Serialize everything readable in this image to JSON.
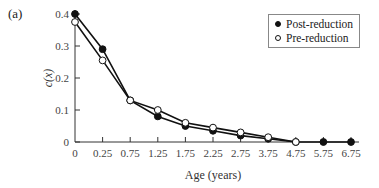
{
  "panel_label": "(a)",
  "legend": {
    "items": [
      {
        "label": "Post-reduction",
        "marker": "filled-circle"
      },
      {
        "label": "Pre-reduction",
        "marker": "open-circle"
      }
    ]
  },
  "chart_data": {
    "type": "line",
    "title": "",
    "xlabel": "Age (years)",
    "ylabel": "c(x)",
    "x": [
      0,
      0.25,
      0.75,
      1.25,
      1.75,
      2.25,
      2.75,
      3.75,
      4.75,
      5.75,
      6.75
    ],
    "x_tick_labels": [
      "0",
      "0.25",
      "0.75",
      "1.25",
      "1.75",
      "2.25",
      "2.75",
      "3.75",
      "4.75",
      "5.75",
      "6.75"
    ],
    "y_tick_labels": [
      "0",
      "0.1",
      "0.2",
      "0.3",
      "0.4"
    ],
    "ylim": [
      0,
      0.4
    ],
    "grid": false,
    "legend_position": "upper right",
    "series": [
      {
        "name": "Post-reduction",
        "marker": "filled-circle",
        "values": [
          0.4,
          0.29,
          0.13,
          0.08,
          0.05,
          0.035,
          0.02,
          0.01,
          0.0,
          0.0,
          0.0
        ]
      },
      {
        "name": "Pre-reduction",
        "marker": "open-circle",
        "values": [
          0.375,
          0.255,
          0.13,
          0.1,
          0.06,
          0.045,
          0.03,
          0.015,
          0.0,
          null,
          null
        ]
      }
    ]
  }
}
